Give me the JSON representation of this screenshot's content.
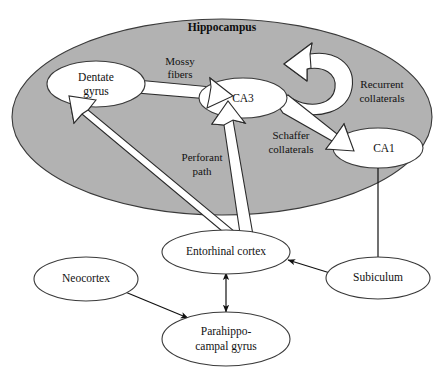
{
  "figure": {
    "type": "diagram",
    "background_color": "#ffffff"
  },
  "container": {
    "label": "Hippocampus",
    "fill_color": "#b2b2b2",
    "stroke_color": "#3a3a3a"
  },
  "regions": [
    {
      "id": "dentate",
      "line1": "Dentate",
      "line2": "gyrus",
      "fill": "#ffffff"
    },
    {
      "id": "ca3",
      "line1": "CA3",
      "line2": "",
      "fill": "#ffffff"
    },
    {
      "id": "ca1",
      "line1": "CA1",
      "line2": "",
      "fill": "#ffffff"
    },
    {
      "id": "entorhinal",
      "line1": "Entorhinal cortex",
      "line2": "",
      "fill": "#ffffff"
    },
    {
      "id": "subiculum",
      "line1": "Subiculum",
      "line2": "",
      "fill": "#ffffff"
    },
    {
      "id": "neocortex",
      "line1": "Neocortex",
      "line2": "",
      "fill": "#ffffff"
    },
    {
      "id": "parahippocampal",
      "line1": "Parahippo-",
      "line2": "campal gyrus",
      "fill": "#ffffff"
    }
  ],
  "pathways": [
    {
      "id": "mossy",
      "line1": "Mossy",
      "line2": "fibers",
      "from": "Dentate gyrus",
      "to": "CA3",
      "style": "block-arrow"
    },
    {
      "id": "recurrent",
      "line1": "Recurrent",
      "line2": "collaterals",
      "from": "CA3",
      "to": "CA3",
      "style": "block-arrow-loop"
    },
    {
      "id": "schaffer",
      "line1": "Schaffer",
      "line2": "collaterals",
      "from": "CA3",
      "to": "CA1",
      "style": "block-arrow"
    },
    {
      "id": "perforant",
      "line1": "Perforant",
      "line2": "path",
      "from": "Entorhinal cortex",
      "to": "Dentate gyrus and CA3",
      "style": "block-arrow"
    }
  ],
  "thin_connections": [
    {
      "id": "ca1-subiculum",
      "from": "CA1",
      "to": "Subiculum",
      "heads": "single"
    },
    {
      "id": "subiculum-entorhinal",
      "from": "Subiculum",
      "to": "Entorhinal cortex",
      "heads": "single"
    },
    {
      "id": "entorhinal-parahippocampal",
      "from": "Entorhinal cortex",
      "to": "Parahippocampal gyrus",
      "heads": "double"
    },
    {
      "id": "neocortex-parahippocampal",
      "from": "Neocortex",
      "to": "Parahippocampal gyrus",
      "heads": "double"
    }
  ],
  "colors": {
    "hippocampus_fill": "#b2b2b2",
    "ellipse_stroke": "#3a3a3a",
    "white_arrow_fill": "#ffffff",
    "white_arrow_stroke": "#2b2b2b",
    "thin_arrow": "#111111",
    "text": "#111111"
  }
}
